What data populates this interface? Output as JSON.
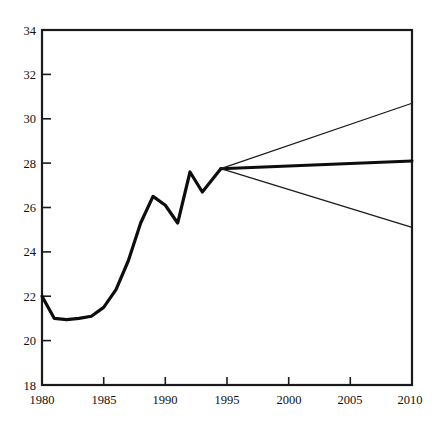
{
  "chart_data": {
    "type": "line",
    "title": "",
    "subtitle": "",
    "xlabel": "",
    "ylabel": "",
    "xlim": [
      1980,
      2010
    ],
    "ylim": [
      18,
      34
    ],
    "grid": false,
    "legend": "none",
    "x_ticks": [
      1980,
      1985,
      1990,
      1995,
      2000,
      2005,
      2010
    ],
    "y_ticks": [
      18,
      20,
      22,
      24,
      26,
      28,
      30,
      32,
      34
    ],
    "x_tick_labels": [
      "1980",
      "1985",
      "1990",
      "1995",
      "2000",
      "2005",
      "2010"
    ],
    "y_tick_labels": [
      "18",
      "20",
      "22",
      "24",
      "26",
      "28",
      "30",
      "32",
      "34"
    ],
    "series": [
      {
        "name": "historical",
        "style": "thick-solid",
        "color": "#0d0d0d",
        "x": [
          1980,
          1981,
          1982,
          1983,
          1984,
          1985,
          1986,
          1987,
          1988,
          1989,
          1990,
          1991,
          1992,
          1993,
          1994.5
        ],
        "values": [
          22.0,
          21.0,
          20.95,
          21.0,
          21.1,
          21.5,
          22.3,
          23.6,
          25.3,
          26.5,
          26.1,
          25.3,
          27.6,
          26.7,
          27.75
        ]
      },
      {
        "name": "central-projection",
        "style": "thick-solid",
        "color": "#0d0d0d",
        "x": [
          1994.5,
          2010
        ],
        "values": [
          27.75,
          28.1
        ]
      },
      {
        "name": "upper-projection",
        "style": "thin-solid",
        "color": "#1a1a1a",
        "x": [
          1994.5,
          2010
        ],
        "values": [
          27.75,
          30.7
        ]
      },
      {
        "name": "lower-projection",
        "style": "thin-solid",
        "color": "#1a1a1a",
        "x": [
          1994.5,
          2010
        ],
        "values": [
          27.75,
          25.1
        ]
      }
    ]
  },
  "axis": {
    "y_label_18": "18",
    "y_label_20": "20",
    "y_label_22": "22",
    "y_label_24": "24",
    "y_label_26": "26",
    "y_label_28": "28",
    "y_label_30": "30",
    "y_label_32": "32",
    "y_label_34": "34",
    "x_label_1980": "1980",
    "x_label_1985": "1985",
    "x_label_1990": "1990",
    "x_label_1995": "1995",
    "x_label_2000": "2000",
    "x_label_2005": "2005",
    "x_label_2010": "2010"
  }
}
